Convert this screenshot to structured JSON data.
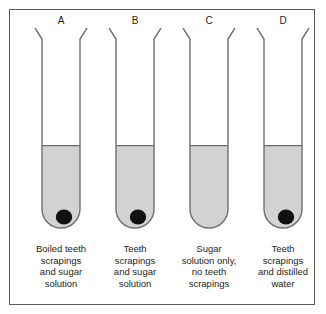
{
  "figure": {
    "background_color": "#ffffff",
    "frame_color": "#5a5a5a",
    "liquid_color": "#d2d2d2",
    "deposit_color": "#111111",
    "glass_color": "#6e6e6e"
  },
  "tubes": [
    {
      "letter": "A",
      "caption_lines": [
        "Boiled teeth",
        "scrapings",
        "and sugar",
        "solution"
      ],
      "has_deposit": true,
      "liquid_level_fraction": 0.62
    },
    {
      "letter": "B",
      "caption_lines": [
        "Teeth",
        "scrapings",
        "and sugar",
        "solution"
      ],
      "has_deposit": true,
      "liquid_level_fraction": 0.62
    },
    {
      "letter": "C",
      "caption_lines": [
        "Sugar",
        "solution only,",
        "no teeth",
        "scrapings"
      ],
      "has_deposit": false,
      "liquid_level_fraction": 0.62
    },
    {
      "letter": "D",
      "caption_lines": [
        "Teeth",
        "scrapings",
        "and distilled",
        "water"
      ],
      "has_deposit": true,
      "liquid_level_fraction": 0.62
    }
  ]
}
